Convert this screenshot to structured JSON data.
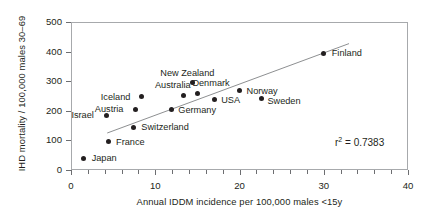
{
  "chart_data": {
    "type": "scatter",
    "title": "",
    "xlabel": "Annual IDDM incidence per 100,000 males <15y",
    "ylabel": "IHD mortality / 100,000 males 30–69",
    "xlim": [
      0,
      40
    ],
    "ylim": [
      0,
      500
    ],
    "xticks": [
      "0",
      "10",
      "20",
      "30",
      "40"
    ],
    "xtick_values": [
      0,
      10,
      20,
      30,
      40
    ],
    "xminor_step": 2,
    "yticks": [
      "0",
      "100",
      "200",
      "300",
      "400",
      "500"
    ],
    "ytick_values": [
      0,
      100,
      200,
      300,
      400,
      500
    ],
    "grid": false,
    "legend": "none",
    "annotation": "r² = 0.7383",
    "annotation_label": "r",
    "annotation_sup": "2",
    "annotation_value": "= 0.7383",
    "trendline": {
      "x1": 4.3,
      "y1": 125,
      "x2": 33.0,
      "y2": 427
    },
    "points": [
      {
        "label": "Japan",
        "x": 1.5,
        "y": 40,
        "lx": 8,
        "ly": -4
      },
      {
        "label": "France",
        "x": 4.4,
        "y": 95,
        "lx": 8,
        "ly": -4
      },
      {
        "label": "Israel",
        "x": 4.2,
        "y": 185,
        "lx": -35,
        "ly": -4
      },
      {
        "label": "Switzerland",
        "x": 7.4,
        "y": 145,
        "lx": 8,
        "ly": -4
      },
      {
        "label": "Austria",
        "x": 7.7,
        "y": 205,
        "lx": -41,
        "ly": -4
      },
      {
        "label": "Iceland",
        "x": 8.4,
        "y": 247,
        "lx": -41,
        "ly": -4
      },
      {
        "label": "Germany",
        "x": 11.9,
        "y": 203,
        "lx": 7,
        "ly": -4
      },
      {
        "label": "Australia",
        "x": 13.4,
        "y": 253,
        "lx": -29,
        "ly": -14
      },
      {
        "label": "New Zealand",
        "x": 14.4,
        "y": 294,
        "lx": -32,
        "ly": -14
      },
      {
        "label": "Denmark",
        "x": 15.0,
        "y": 260,
        "lx": -5,
        "ly": -14
      },
      {
        "label": "USA",
        "x": 17.0,
        "y": 237,
        "lx": 7,
        "ly": -4
      },
      {
        "label": "Norway",
        "x": 20.0,
        "y": 267,
        "lx": 7,
        "ly": -4
      },
      {
        "label": "Sweden",
        "x": 22.6,
        "y": 240,
        "lx": 6,
        "ly": -2
      },
      {
        "label": "Finland",
        "x": 30.0,
        "y": 395,
        "lx": 8,
        "ly": -4
      }
    ],
    "colors": {
      "marker": "#231f20",
      "axis": "#a7a9ac",
      "trendline": "#808285",
      "text": "#231f20",
      "background": "#ffffff"
    }
  }
}
